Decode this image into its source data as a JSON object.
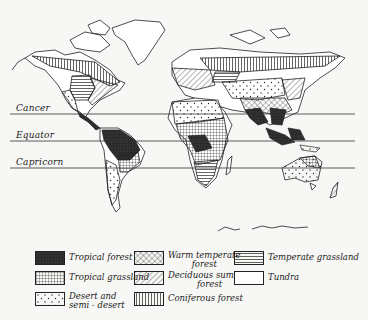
{
  "map": {
    "title": "World natural vegetation regions",
    "latitude_lines": [
      {
        "label": "Cancer",
        "y": 114
      },
      {
        "label": "Equator",
        "y": 141
      },
      {
        "label": "Capricorn",
        "y": 168
      }
    ]
  },
  "legend": {
    "items": [
      {
        "id": "tropical-forest",
        "label": "Tropical forest",
        "pattern": "dense-dark"
      },
      {
        "id": "warm-temperate-forest",
        "label": "Warm temperate\nforest",
        "pattern": "cross-hatch"
      },
      {
        "id": "temperate-grassland",
        "label": "Temperate grassland",
        "pattern": "horizontal-lines"
      },
      {
        "id": "tropical-grassland",
        "label": "Tropical grassland",
        "pattern": "grid"
      },
      {
        "id": "deciduous-summer-forest",
        "label": "Deciduous summer\nforest",
        "pattern": "diagonal-lines"
      },
      {
        "id": "tundra",
        "label": "Tundra",
        "pattern": "blank"
      },
      {
        "id": "desert-semi-desert",
        "label": "Desert and\nsemi - desert",
        "pattern": "dots"
      },
      {
        "id": "coniferous-forest",
        "label": "Coniferous forest",
        "pattern": "vertical-lines"
      }
    ]
  },
  "colors": {
    "ink": "#222222",
    "paper": "#f7f7f5",
    "dark_fill": "#2a2a2a"
  }
}
